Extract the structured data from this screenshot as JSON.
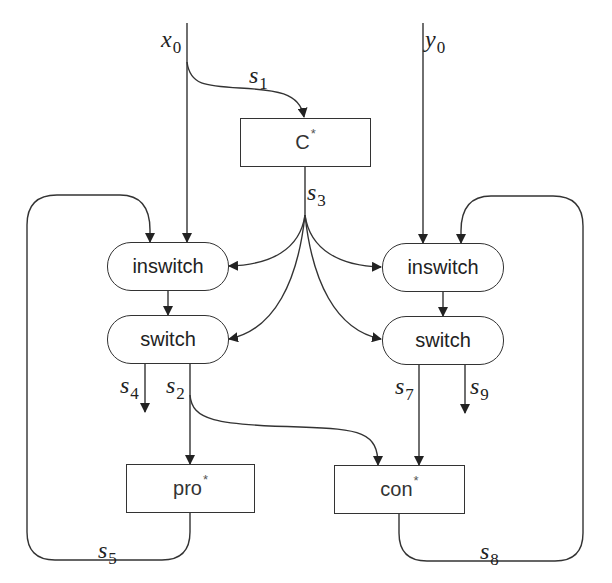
{
  "diagram": {
    "nodes": {
      "c_star": {
        "label": "C",
        "sup": "*"
      },
      "inswitch_left": {
        "label": "inswitch"
      },
      "switch_left": {
        "label": "switch"
      },
      "inswitch_right": {
        "label": "inswitch"
      },
      "switch_right": {
        "label": "switch"
      },
      "pro_star": {
        "label": "pro",
        "sup": "*"
      },
      "con_star": {
        "label": "con",
        "sup": "*"
      }
    },
    "inputs": {
      "x0": {
        "var": "x",
        "sub": "0"
      },
      "y0": {
        "var": "y",
        "sub": "0"
      }
    },
    "signals": {
      "s1": {
        "var": "s",
        "sub": "1"
      },
      "s2": {
        "var": "s",
        "sub": "2"
      },
      "s3": {
        "var": "s",
        "sub": "3"
      },
      "s4": {
        "var": "s",
        "sub": "4"
      },
      "s5": {
        "var": "s",
        "sub": "5"
      },
      "s7": {
        "var": "s",
        "sub": "7"
      },
      "s8": {
        "var": "s",
        "sub": "8"
      },
      "s9": {
        "var": "s",
        "sub": "9"
      }
    },
    "edges": [
      {
        "from": "x0",
        "to": "inswitch_left"
      },
      {
        "from": "x0",
        "to": "c_star",
        "label": "s1"
      },
      {
        "from": "y0",
        "to": "inswitch_right"
      },
      {
        "from": "c_star",
        "to": "inswitch_left",
        "label": "s3"
      },
      {
        "from": "c_star",
        "to": "switch_left",
        "label": "s3"
      },
      {
        "from": "c_star",
        "to": "inswitch_right",
        "label": "s3"
      },
      {
        "from": "c_star",
        "to": "switch_right",
        "label": "s3"
      },
      {
        "from": "inswitch_left",
        "to": "switch_left"
      },
      {
        "from": "inswitch_right",
        "to": "switch_right"
      },
      {
        "from": "switch_left",
        "to": "out",
        "label": "s4"
      },
      {
        "from": "switch_left",
        "to": "pro_star",
        "label": "s2"
      },
      {
        "from": "switch_left",
        "to": "con_star",
        "label": "s2"
      },
      {
        "from": "switch_right",
        "to": "con_star",
        "label": "s7"
      },
      {
        "from": "switch_right",
        "to": "out",
        "label": "s9"
      },
      {
        "from": "pro_star",
        "to": "inswitch_left",
        "label": "s5"
      },
      {
        "from": "con_star",
        "to": "inswitch_right",
        "label": "s8"
      }
    ],
    "colors": {
      "line": "#333333",
      "background": "#ffffff"
    }
  }
}
